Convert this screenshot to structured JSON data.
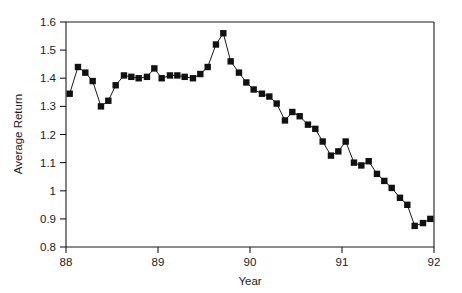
{
  "chart_data": {
    "type": "line",
    "title": "",
    "subtitle": "",
    "xlabel": "Year",
    "ylabel": "Average Return",
    "xlim": [
      88,
      92
    ],
    "ylim": [
      0.8,
      1.6
    ],
    "xticks": [
      88,
      89,
      90,
      91,
      92
    ],
    "xtick_labels": [
      "88",
      "89",
      "90",
      "91",
      "92"
    ],
    "yticks": [
      0.8,
      0.9,
      1.0,
      1.1,
      1.2,
      1.3,
      1.4,
      1.5,
      1.6
    ],
    "ytick_labels": [
      "0.8",
      "0.9",
      "1",
      "1.1",
      "1.2",
      "1.3",
      "1.4",
      "1.5",
      "1.6"
    ],
    "grid": false,
    "legend": null,
    "marker": "filled-square",
    "marker_color": "#111111",
    "line_color": "#1a1a1a",
    "series": [
      {
        "name": "Average Return",
        "x": [
          88.04,
          88.13,
          88.21,
          88.29,
          88.38,
          88.46,
          88.54,
          88.63,
          88.71,
          88.79,
          88.88,
          88.96,
          89.04,
          89.13,
          89.21,
          89.29,
          89.38,
          89.46,
          89.54,
          89.63,
          89.71,
          89.79,
          89.88,
          89.96,
          90.04,
          90.13,
          90.21,
          90.29,
          90.38,
          90.46,
          90.54,
          90.63,
          90.71,
          90.79,
          90.88,
          90.96,
          91.04,
          91.13,
          91.21,
          91.29,
          91.38,
          91.46,
          91.54,
          91.63,
          91.71,
          91.79,
          91.88,
          91.96
        ],
        "y": [
          1.345,
          1.44,
          1.42,
          1.39,
          1.3,
          1.32,
          1.375,
          1.41,
          1.405,
          1.4,
          1.405,
          1.435,
          1.4,
          1.41,
          1.41,
          1.405,
          1.4,
          1.415,
          1.44,
          1.52,
          1.56,
          1.46,
          1.42,
          1.385,
          1.36,
          1.345,
          1.335,
          1.31,
          1.25,
          1.28,
          1.265,
          1.235,
          1.22,
          1.175,
          1.125,
          1.14,
          1.175,
          1.1,
          1.09,
          1.105,
          1.06,
          1.035,
          1.01,
          0.975,
          0.95,
          0.875,
          0.885,
          0.9
        ]
      }
    ]
  },
  "axes": {
    "y_axis_label": "Average Return",
    "x_axis_label": "Year"
  }
}
